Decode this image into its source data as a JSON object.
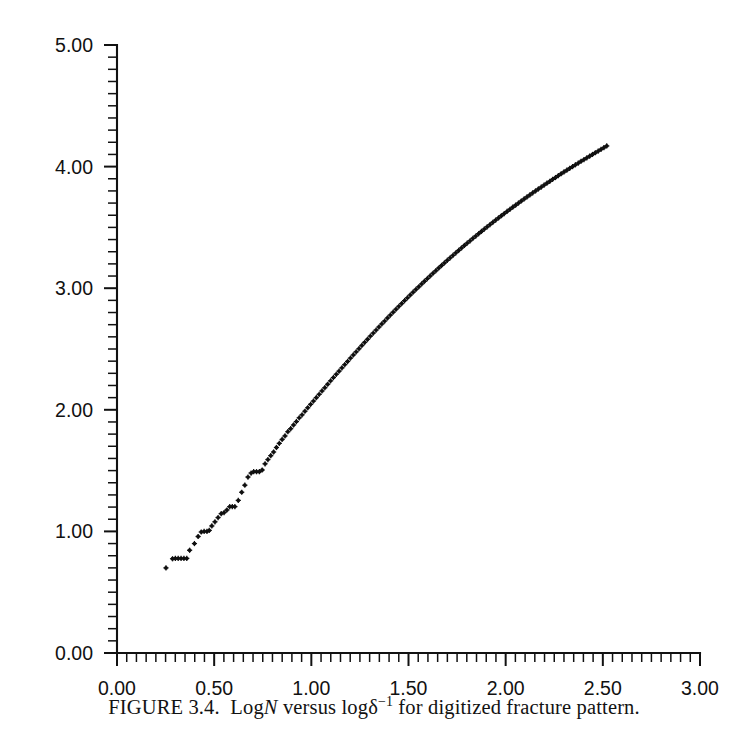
{
  "caption": {
    "prefix": "FIGURE 3.4.",
    "text_before_n": "Log",
    "italic_n": "N",
    "text_middle": "versus log",
    "delta": "δ",
    "delta_exponent": "−1",
    "text_after": "for digitized fracture pattern.",
    "full": "FIGURE 3.4.  Log N versus log δ−1 for digitized fracture pattern."
  },
  "chart_data": {
    "type": "scatter",
    "title": "",
    "xlabel": "",
    "ylabel": "",
    "xlim": [
      0.0,
      3.0
    ],
    "ylim": [
      0.0,
      5.0
    ],
    "x_major_ticks": [
      0.0,
      0.5,
      1.0,
      1.5,
      2.0,
      2.5,
      3.0
    ],
    "x_major_tick_labels": [
      "0.00",
      "0.50",
      "1.00",
      "1.50",
      "2.00",
      "2.50",
      "3.00"
    ],
    "x_minor_tick_step": 0.05,
    "y_major_ticks": [
      0.0,
      1.0,
      2.0,
      3.0,
      4.0,
      5.0
    ],
    "y_major_tick_labels": [
      "0.00",
      "1.00",
      "2.00",
      "3.00",
      "4.00",
      "5.00"
    ],
    "y_minor_tick_step": 0.1,
    "grid": false,
    "legend": null,
    "marker": "star",
    "marker_color": "#101010",
    "series": [
      {
        "name": "log N vs log delta^-1",
        "points": [
          [
            0.252,
            0.7
          ],
          [
            0.298,
            0.775
          ],
          [
            0.318,
            0.778
          ],
          [
            0.338,
            0.778
          ],
          [
            0.358,
            0.778
          ],
          [
            0.378,
            0.778
          ],
          [
            0.398,
            0.778
          ],
          [
            0.418,
            0.845
          ],
          [
            0.452,
            0.9
          ],
          [
            0.478,
            0.958
          ],
          [
            0.5,
            0.995
          ],
          [
            0.52,
            1.0
          ],
          [
            0.54,
            1.0
          ],
          [
            0.556,
            1.008
          ],
          [
            0.574,
            1.045
          ],
          [
            0.596,
            1.079
          ],
          [
            0.618,
            1.114
          ],
          [
            0.64,
            1.146
          ],
          [
            0.66,
            1.155
          ],
          [
            0.68,
            1.176
          ],
          [
            0.7,
            1.204
          ],
          [
            0.718,
            1.204
          ],
          [
            0.736,
            1.204
          ],
          [
            0.76,
            1.255
          ],
          [
            0.784,
            1.322
          ],
          [
            0.806,
            1.38
          ],
          [
            0.828,
            1.447
          ],
          [
            0.85,
            1.48
          ],
          [
            0.868,
            1.491
          ],
          [
            0.888,
            1.491
          ],
          [
            0.908,
            1.491
          ],
          [
            0.928,
            1.505
          ],
          [
            0.948,
            1.556
          ],
          [
            0.968,
            1.591
          ],
          [
            0.988,
            1.623
          ],
          [
            1.008,
            1.653
          ],
          [
            1.028,
            1.69
          ],
          [
            1.048,
            1.724
          ],
          [
            1.068,
            1.756
          ],
          [
            1.088,
            1.785
          ],
          [
            1.108,
            1.82
          ],
          [
            1.128,
            1.845
          ],
          [
            1.148,
            1.875
          ],
          [
            1.168,
            1.903
          ],
          [
            1.188,
            1.934
          ],
          [
            1.208,
            1.959
          ],
          [
            1.228,
            1.988
          ],
          [
            1.248,
            2.017
          ],
          [
            1.268,
            2.045
          ],
          [
            1.288,
            2.072
          ],
          [
            1.308,
            2.1
          ],
          [
            1.328,
            2.127
          ],
          [
            1.348,
            2.155
          ],
          [
            1.368,
            2.182
          ],
          [
            1.388,
            2.21
          ],
          [
            1.408,
            2.238
          ],
          [
            1.428,
            2.265
          ],
          [
            1.448,
            2.292
          ],
          [
            1.468,
            2.318
          ],
          [
            1.488,
            2.345
          ],
          [
            1.508,
            2.372
          ],
          [
            1.528,
            2.398
          ],
          [
            1.548,
            2.425
          ],
          [
            1.568,
            2.451
          ],
          [
            1.588,
            2.477
          ],
          [
            1.608,
            2.503
          ],
          [
            1.628,
            2.529
          ],
          [
            1.648,
            2.555
          ],
          [
            1.668,
            2.58
          ],
          [
            1.688,
            2.606
          ],
          [
            1.708,
            2.631
          ],
          [
            1.728,
            2.656
          ],
          [
            1.748,
            2.681
          ],
          [
            1.768,
            2.706
          ],
          [
            1.788,
            2.73
          ],
          [
            1.808,
            2.755
          ],
          [
            1.828,
            2.779
          ],
          [
            1.848,
            2.803
          ],
          [
            1.868,
            2.827
          ],
          [
            1.888,
            2.851
          ],
          [
            1.908,
            2.874
          ],
          [
            1.928,
            2.898
          ],
          [
            1.948,
            2.921
          ],
          [
            1.968,
            2.944
          ],
          [
            1.988,
            2.967
          ],
          [
            2.008,
            2.99
          ],
          [
            2.028,
            3.012
          ],
          [
            2.048,
            3.035
          ],
          [
            2.068,
            3.057
          ],
          [
            2.088,
            3.079
          ],
          [
            2.108,
            3.101
          ],
          [
            2.128,
            3.123
          ],
          [
            2.148,
            3.144
          ],
          [
            2.168,
            3.166
          ],
          [
            2.188,
            3.187
          ],
          [
            2.208,
            3.208
          ],
          [
            2.228,
            3.229
          ],
          [
            2.248,
            3.25
          ],
          [
            2.268,
            3.27
          ],
          [
            2.288,
            3.291
          ],
          [
            2.308,
            3.311
          ],
          [
            2.328,
            3.331
          ],
          [
            2.348,
            3.351
          ],
          [
            2.368,
            3.371
          ],
          [
            2.388,
            3.39
          ],
          [
            2.408,
            3.41
          ],
          [
            2.428,
            3.429
          ],
          [
            2.448,
            3.448
          ],
          [
            2.468,
            3.467
          ],
          [
            2.488,
            3.486
          ],
          [
            2.508,
            3.505
          ],
          [
            2.528,
            3.523
          ],
          [
            2.548,
            3.542
          ],
          [
            2.568,
            3.56
          ],
          [
            2.588,
            3.578
          ],
          [
            2.608,
            3.596
          ],
          [
            2.628,
            3.614
          ],
          [
            2.648,
            3.631
          ],
          [
            2.668,
            3.649
          ],
          [
            2.688,
            3.666
          ],
          [
            2.708,
            3.683
          ],
          [
            2.728,
            3.7
          ],
          [
            2.748,
            3.717
          ],
          [
            2.768,
            3.734
          ],
          [
            2.788,
            3.751
          ],
          [
            2.808,
            3.767
          ],
          [
            2.828,
            3.784
          ],
          [
            2.848,
            3.8
          ],
          [
            2.868,
            3.816
          ],
          [
            2.888,
            3.832
          ],
          [
            2.908,
            3.848
          ],
          [
            2.928,
            3.864
          ],
          [
            2.948,
            3.879
          ],
          [
            2.968,
            3.895
          ],
          [
            2.988,
            3.91
          ],
          [
            3.008,
            3.926
          ],
          [
            3.028,
            3.941
          ],
          [
            3.048,
            3.956
          ],
          [
            3.068,
            3.971
          ],
          [
            3.088,
            3.986
          ],
          [
            3.108,
            4.0
          ],
          [
            3.128,
            4.015
          ],
          [
            3.148,
            4.029
          ],
          [
            3.168,
            4.044
          ],
          [
            3.188,
            4.058
          ],
          [
            3.208,
            4.072
          ],
          [
            3.228,
            4.086
          ],
          [
            3.248,
            4.1
          ],
          [
            3.268,
            4.114
          ],
          [
            3.288,
            4.128
          ],
          [
            3.308,
            4.142
          ],
          [
            3.328,
            4.156
          ],
          [
            3.348,
            4.17
          ]
        ]
      }
    ],
    "note": "Point x-values beyond 2.52 are rescaled by the plot geometry; rendered x = min(x, 2.52)."
  },
  "axes": {
    "x_axis_name": "x-axis",
    "y_axis_name": "y-axis"
  }
}
